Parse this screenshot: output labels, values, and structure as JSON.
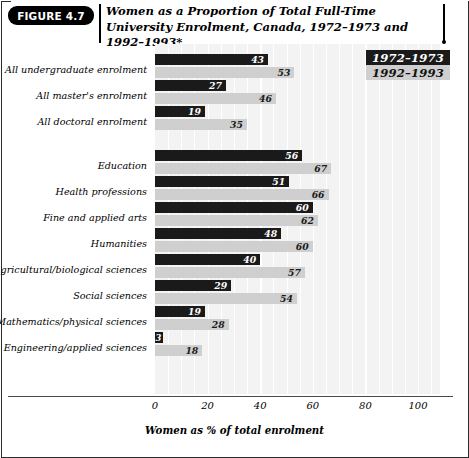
{
  "figure": {
    "badge": "FIGURE 4.7",
    "title": "Women as a Proportion of Total Full-Time University Enrolment, Canada, 1972–1973 and 1992–1993*"
  },
  "legend": {
    "items": [
      {
        "label": "1972–1973",
        "color": "#1a1a1a",
        "text_color": "#ffffff"
      },
      {
        "label": "1992–1993",
        "color": "#cfcfcf",
        "text_color": "#111111"
      }
    ]
  },
  "axis": {
    "ticks": [
      "0",
      "20",
      "40",
      "60",
      "80",
      "100"
    ],
    "xlabel": "Women as % of total enrolment"
  },
  "chart_data": {
    "type": "bar",
    "orientation": "horizontal",
    "title": "Women as a Proportion of Total Full-Time University Enrolment, Canada, 1972–1973 and 1992–1993*",
    "xlabel": "Women as % of total enrolment",
    "ylabel": "",
    "xlim": [
      0,
      110
    ],
    "xticks": [
      0,
      20,
      40,
      60,
      80,
      100
    ],
    "grid": true,
    "legend_position": "top-right",
    "categories": [
      "All undergraduate enrolment",
      "All master's enrolment",
      "All doctoral enrolment",
      "Education",
      "Health professions",
      "Fine and applied arts",
      "Humanities",
      "Agricultural/biological sciences",
      "Social sciences",
      "Mathematics/physical sciences",
      "Engineering/applied sciences"
    ],
    "series": [
      {
        "name": "1972–1973",
        "color": "#1a1a1a",
        "values": [
          43,
          27,
          19,
          56,
          51,
          60,
          48,
          40,
          29,
          19,
          3
        ]
      },
      {
        "name": "1992–1993",
        "color": "#cfcfcf",
        "values": [
          53,
          46,
          35,
          67,
          66,
          62,
          60,
          57,
          54,
          28,
          18
        ]
      }
    ],
    "groups": [
      {
        "label": "All undergraduate enrolment",
        "v1972": 43,
        "v1992": 53
      },
      {
        "label": "All master's enrolment",
        "v1972": 27,
        "v1992": 46
      },
      {
        "label": "All doctoral enrolment",
        "v1972": 19,
        "v1992": 35
      },
      {
        "label": "Education",
        "v1972": 56,
        "v1992": 67
      },
      {
        "label": "Health professions",
        "v1972": 51,
        "v1992": 66
      },
      {
        "label": "Fine and applied arts",
        "v1972": 60,
        "v1992": 62
      },
      {
        "label": "Humanities",
        "v1972": 48,
        "v1992": 60
      },
      {
        "label": "Agricultural/biological sciences",
        "v1972": 40,
        "v1992": 57
      },
      {
        "label": "Social sciences",
        "v1972": 29,
        "v1992": 54
      },
      {
        "label": "Mathematics/physical sciences",
        "v1972": 19,
        "v1992": 28
      },
      {
        "label": "Engineering/applied sciences",
        "v1972": 3,
        "v1992": 18
      }
    ]
  }
}
